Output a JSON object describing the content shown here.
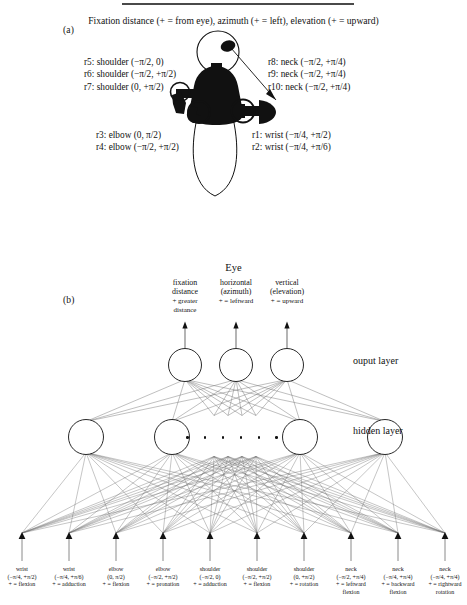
{
  "figure": {
    "panel_a_tag": "(a)",
    "panel_b_tag": "(b)",
    "top_caption": "Fixation distance (+ = from eye), azimuth (+ = left), elevation (+ = upward)",
    "annotations": {
      "shoulder_block": "r5: shoulder (−π/2, 0)\nr6: shoulder (−π/2, +π/2)\nr7: shoulder (0, +π/2)",
      "neck_block": "r8: neck (−π/2, +π/4)\nr9: neck (−π/2, +π/4)\nr10: neck (−π/2, +π/4)",
      "elbow_block": "r3: elbow (0, π/2)\nr4: elbow (−π/2, +π/2)",
      "wrist_block": "r1: wrist (−π/4, +π/2)\nr2: wrist (−π/4, +π/6)"
    }
  },
  "network": {
    "eye_title": "Eye",
    "output_layer_label": "ouput layer",
    "hidden_layer_label": "hidden layer",
    "outputs": [
      {
        "name": "fixation distance",
        "line1": "fixation",
        "line2": "distance",
        "sign1": "+ greater",
        "sign2": "distance"
      },
      {
        "name": "horizontal azimuth",
        "line1": "horizontal",
        "line2": "(azimuth)",
        "sign1": "+ = leftward",
        "sign2": ""
      },
      {
        "name": "vertical elevation",
        "line1": "vertical",
        "line2": "(elevation)",
        "sign1": "+ = upward",
        "sign2": ""
      }
    ],
    "inputs": [
      {
        "joint": "wrist",
        "range": "(−π/4, +π/2)",
        "dir1": "+ = flexion",
        "dir2": ""
      },
      {
        "joint": "wrist",
        "range": "(−π/4, +π/6)",
        "dir1": "+ = adduction",
        "dir2": ""
      },
      {
        "joint": "elbow",
        "range": "(0, π/2)",
        "dir1": "+ = flexion",
        "dir2": ""
      },
      {
        "joint": "elbow",
        "range": "(−π/2, +π/2)",
        "dir1": "+ = pronation",
        "dir2": ""
      },
      {
        "joint": "shoulder",
        "range": "(−π/2, 0)",
        "dir1": "+ = adduction",
        "dir2": ""
      },
      {
        "joint": "shoulder",
        "range": "(−π/2, +π/2)",
        "dir1": "+ = flexion",
        "dir2": ""
      },
      {
        "joint": "shoulder",
        "range": "(0, +π/2)",
        "dir1": "+ = rotation",
        "dir2": ""
      },
      {
        "joint": "neck",
        "range": "(−π/2, +π/4)",
        "dir1": "+ = leftward",
        "dir2": "flexion"
      },
      {
        "joint": "neck",
        "range": "(−π/4, +π/4)",
        "dir1": "+ = backward",
        "dir2": "flexion"
      },
      {
        "joint": "neck",
        "range": "(−π/4, +π/4)",
        "dir1": "+ = rightward",
        "dir2": "rotation"
      }
    ],
    "hidden_units_shown": 4,
    "ellipsis_dots": 6
  },
  "colors": {
    "ink": "#111111",
    "link": "#6f6f6f",
    "rule": "#4a4a4a"
  }
}
